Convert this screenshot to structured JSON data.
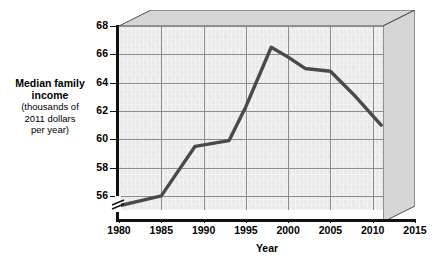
{
  "chart_data": {
    "type": "line",
    "title": "",
    "xlabel": "Year",
    "ylabel": "Median family income (thousands of 2011 dollars per year)",
    "ylabel_main": "Median family income",
    "ylabel_sub_line1": "(thousands of",
    "ylabel_sub_line2": "2011 dollars",
    "ylabel_sub_line3": "per year)",
    "xlim": [
      1980,
      2015
    ],
    "ylim": [
      55,
      68
    ],
    "y_axis_break": true,
    "grid": true,
    "legend": "none",
    "x_ticks": [
      1980,
      1985,
      1990,
      1995,
      2000,
      2005,
      2010,
      2015
    ],
    "x_tick_labels": [
      "1980",
      "1985",
      "1990",
      "1995",
      "2000",
      "2005",
      "2010",
      "2015"
    ],
    "y_ticks": [
      56,
      58,
      60,
      62,
      64,
      66,
      68
    ],
    "y_tick_labels": [
      "56",
      "58",
      "60",
      "62",
      "64",
      "66",
      "68"
    ],
    "series": [
      {
        "name": "Median family income",
        "color": "#4a4a4a",
        "x": [
          1980,
          1985,
          1989,
          1993,
          1995,
          1998,
          2000,
          2002,
          2005,
          2008,
          2011
        ],
        "values": [
          55.3,
          56.0,
          59.5,
          59.9,
          62.3,
          66.5,
          65.8,
          65.0,
          64.8,
          63.0,
          61.0
        ]
      }
    ],
    "colors": {
      "line": "#4a4a4a",
      "plot_background": "#ebebeb",
      "gridline": "#8d8d8d",
      "axis": "#111111",
      "bevel": "#d0d0d0",
      "page_background": "#ffffff"
    }
  }
}
